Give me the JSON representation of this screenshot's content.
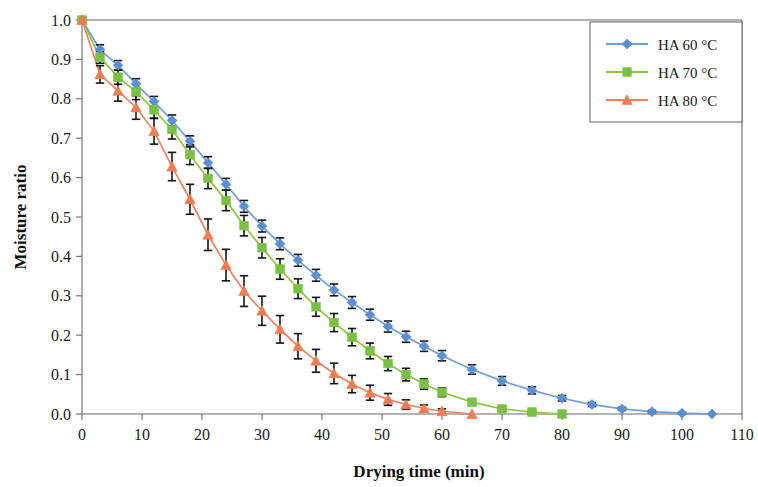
{
  "chart_data": {
    "type": "line",
    "title": "",
    "xlabel": "Drying time (min)",
    "ylabel": "Moisture ratio",
    "xlim": [
      0,
      110
    ],
    "ylim": [
      0.0,
      1.0
    ],
    "xticks": [
      0,
      10,
      20,
      30,
      40,
      50,
      60,
      70,
      80,
      90,
      100,
      110
    ],
    "xtick_labels": [
      "0",
      "10",
      "20",
      "30",
      "40",
      "50",
      "60",
      "70",
      "80",
      "90",
      "100",
      "110"
    ],
    "yticks": [
      0.0,
      0.1,
      0.2,
      0.3,
      0.4,
      0.5,
      0.6,
      0.7,
      0.8,
      0.9,
      1.0
    ],
    "ytick_labels": [
      "0.0",
      "0.1",
      "0.2",
      "0.3",
      "0.4",
      "0.5",
      "0.6",
      "0.7",
      "0.8",
      "0.9",
      "1.0"
    ],
    "grid": false,
    "legend_position": "top-right",
    "error_bars": true,
    "series": [
      {
        "name": "HA 60 °C",
        "color": "#6f9fd8",
        "marker": "diamond",
        "marker_color": "#5b8fd0",
        "x": [
          0,
          3,
          6,
          9,
          12,
          15,
          18,
          21,
          24,
          27,
          30,
          33,
          36,
          39,
          42,
          45,
          48,
          51,
          54,
          57,
          60,
          65,
          70,
          75,
          80,
          85,
          90,
          95,
          100,
          105
        ],
        "values": [
          1.0,
          0.925,
          0.885,
          0.838,
          0.793,
          0.745,
          0.692,
          0.638,
          0.583,
          0.527,
          0.477,
          0.432,
          0.39,
          0.352,
          0.315,
          0.283,
          0.252,
          0.222,
          0.196,
          0.172,
          0.148,
          0.113,
          0.084,
          0.06,
          0.04,
          0.024,
          0.013,
          0.006,
          0.002,
          0.0
        ],
        "errors": [
          0.0,
          0.012,
          0.012,
          0.013,
          0.013,
          0.014,
          0.014,
          0.015,
          0.015,
          0.015,
          0.015,
          0.015,
          0.015,
          0.015,
          0.015,
          0.015,
          0.014,
          0.014,
          0.014,
          0.013,
          0.013,
          0.012,
          0.011,
          0.009,
          0.007,
          0.005,
          0.004,
          0.003,
          0.002,
          0.0
        ]
      },
      {
        "name": "HA 70 °C",
        "color": "#8dc63f",
        "marker": "square",
        "marker_color": "#7ac143",
        "x": [
          0,
          3,
          6,
          9,
          12,
          15,
          18,
          21,
          24,
          27,
          30,
          33,
          36,
          39,
          42,
          45,
          48,
          51,
          54,
          57,
          60,
          65,
          70,
          75,
          80
        ],
        "values": [
          1.0,
          0.905,
          0.855,
          0.818,
          0.772,
          0.722,
          0.658,
          0.598,
          0.542,
          0.478,
          0.422,
          0.368,
          0.318,
          0.272,
          0.232,
          0.195,
          0.16,
          0.128,
          0.1,
          0.076,
          0.055,
          0.03,
          0.013,
          0.005,
          0.0
        ],
        "errors": [
          0.0,
          0.015,
          0.018,
          0.02,
          0.022,
          0.024,
          0.025,
          0.026,
          0.026,
          0.026,
          0.026,
          0.026,
          0.025,
          0.024,
          0.023,
          0.022,
          0.02,
          0.018,
          0.016,
          0.013,
          0.011,
          0.008,
          0.005,
          0.003,
          0.0
        ]
      },
      {
        "name": "HA 80 °C",
        "color": "#f08060",
        "marker": "triangle",
        "marker_color": "#ef7c52",
        "x": [
          0,
          3,
          6,
          9,
          12,
          15,
          18,
          21,
          24,
          27,
          30,
          33,
          36,
          39,
          42,
          45,
          48,
          51,
          54,
          57,
          60,
          65
        ],
        "values": [
          1.0,
          0.862,
          0.82,
          0.778,
          0.718,
          0.628,
          0.545,
          0.455,
          0.378,
          0.312,
          0.262,
          0.215,
          0.172,
          0.135,
          0.103,
          0.076,
          0.054,
          0.037,
          0.024,
          0.014,
          0.007,
          0.0
        ],
        "errors": [
          0.0,
          0.022,
          0.026,
          0.03,
          0.033,
          0.036,
          0.038,
          0.04,
          0.04,
          0.039,
          0.037,
          0.035,
          0.032,
          0.029,
          0.026,
          0.022,
          0.019,
          0.015,
          0.012,
          0.009,
          0.006,
          0.0
        ]
      }
    ]
  },
  "legend": {
    "entries": [
      {
        "label": "HA 60 °C"
      },
      {
        "label": "HA 70 °C"
      },
      {
        "label": "HA 80 °C"
      }
    ]
  }
}
